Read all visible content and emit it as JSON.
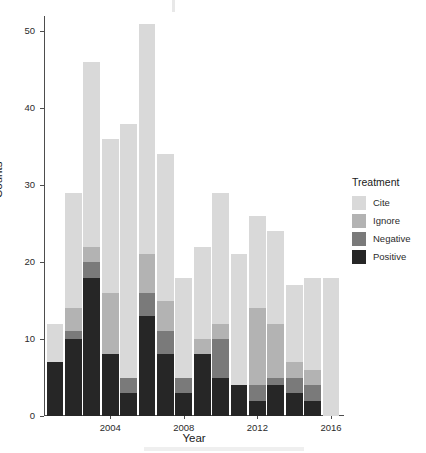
{
  "chart_data": {
    "type": "bar",
    "subtype": "stacked-bar",
    "title": "",
    "xlabel": "Year",
    "ylabel": "Counts",
    "ylim": [
      0,
      52
    ],
    "yticks": [
      0,
      10,
      20,
      30,
      40,
      50
    ],
    "xticks": [
      2004,
      2008,
      2012,
      2016
    ],
    "xlim": [
      2000.4,
      2016.6
    ],
    "grid": false,
    "legend": {
      "title": "Treatment",
      "position": "right",
      "entries": [
        "Cite",
        "Ignore",
        "Negative",
        "Positive"
      ]
    },
    "categories": [
      2001,
      2002,
      2003,
      2004,
      2005,
      2006,
      2007,
      2008,
      2009,
      2010,
      2011,
      2012,
      2013,
      2014,
      2015,
      2016
    ],
    "series": [
      {
        "name": "Positive",
        "color": "#262626",
        "values": [
          7,
          10,
          18,
          8,
          3,
          13,
          8,
          3,
          8,
          5,
          4,
          2,
          4,
          3,
          2,
          0
        ]
      },
      {
        "name": "Negative",
        "color": "#7a7a7a",
        "values": [
          0,
          1,
          2,
          0,
          2,
          3,
          3,
          2,
          0,
          5,
          0,
          2,
          1,
          2,
          2,
          0
        ]
      },
      {
        "name": "Ignore",
        "color": "#b3b3b3",
        "values": [
          0,
          3,
          2,
          8,
          0,
          5,
          4,
          0,
          2,
          2,
          0,
          10,
          7,
          2,
          2,
          0
        ]
      },
      {
        "name": "Cite",
        "color": "#d9d9d9",
        "values": [
          5,
          15,
          24,
          20,
          33,
          30,
          19,
          13,
          12,
          17,
          17,
          12,
          12,
          10,
          12,
          18
        ]
      }
    ],
    "totals": [
      12,
      29,
      46,
      36,
      38,
      51,
      34,
      18,
      22,
      29,
      21,
      26,
      24,
      17,
      18,
      18
    ]
  },
  "axes": {
    "y_title": "Counts",
    "x_title": "Year",
    "y_tick_labels": [
      "0",
      "10",
      "20",
      "30",
      "40",
      "50"
    ],
    "x_tick_labels": [
      "2004",
      "2008",
      "2012",
      "2016"
    ]
  },
  "legend": {
    "title": "Treatment",
    "items": [
      {
        "label": "Cite",
        "color": "#d9d9d9"
      },
      {
        "label": "Ignore",
        "color": "#b3b3b3"
      },
      {
        "label": "Negative",
        "color": "#7a7a7a"
      },
      {
        "label": "Positive",
        "color": "#262626"
      }
    ]
  },
  "style": {
    "background": "#ffffff",
    "axis_color": "#4d4d4d",
    "text_color": "#1a1a1a"
  }
}
